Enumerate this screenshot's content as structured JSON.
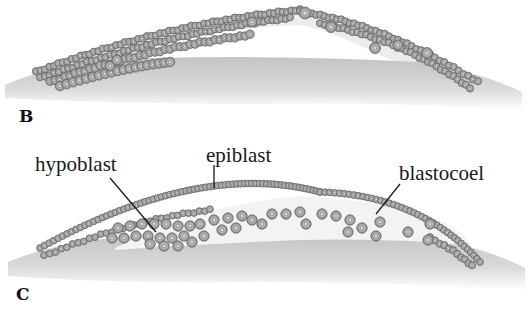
{
  "figure": {
    "panels": [
      {
        "id": "B",
        "label": "B"
      },
      {
        "id": "C",
        "label": "C"
      }
    ],
    "callouts": {
      "hypoblast": "hypoblast",
      "epiblast": "epiblast",
      "blastocoel": "blastocoel"
    },
    "colors": {
      "yolk": "#cfcfcf",
      "cell_fill": "#b8b8b8",
      "cell_stroke": "#6a6a6a",
      "cell_nucleus": "#e6e6e6",
      "cavity": "#f2f2f2",
      "leader_line": "#1a1a1a"
    }
  }
}
